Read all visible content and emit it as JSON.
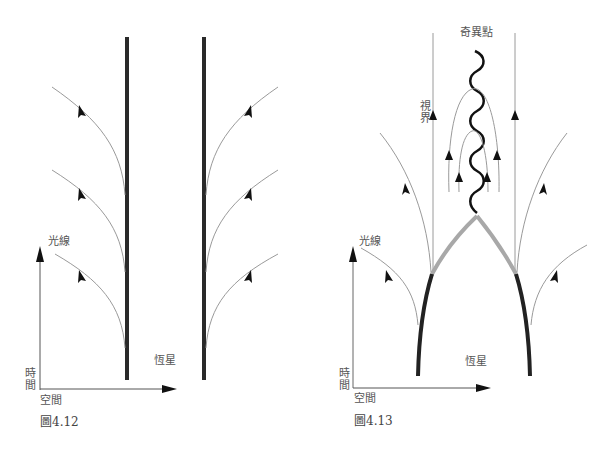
{
  "figures": [
    {
      "id": "fig-4-12",
      "caption": "圖4.12",
      "labels": {
        "light_ray": "光線",
        "time": "時間",
        "space": "空間",
        "star": "恆星"
      },
      "elements": {
        "star_surface_lines": 2,
        "light_rays_per_side": 3
      }
    },
    {
      "id": "fig-4-13",
      "caption": "圖4.13",
      "labels": {
        "singularity": "奇異點",
        "horizon": "視界",
        "light_ray": "光線",
        "time": "時間",
        "space": "空間",
        "star": "恆星"
      },
      "elements": {
        "collapsing_star_surface": 2,
        "event_horizon_lines": 2,
        "trapped_light_rays": 4,
        "escaping_light_rays_per_side": 2
      }
    }
  ],
  "colors": {
    "star": "#2a2a2a",
    "collapsed_star": "#a8a8a8",
    "light_ray": "#9a9a9a",
    "axis": "#555555",
    "singularity": "#111111"
  }
}
